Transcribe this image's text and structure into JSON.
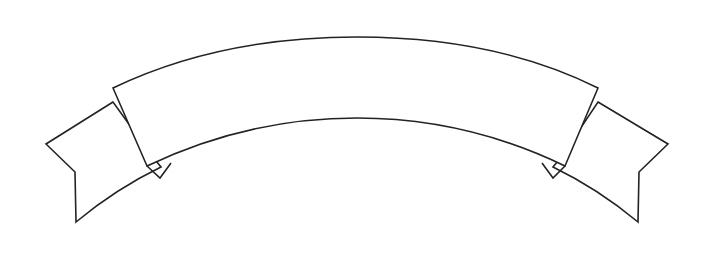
{
  "document": {
    "title": "Banner Ribbon Outline",
    "background_color": "#ffffff",
    "stroke_color": "#232323",
    "fill_color": "#ffffff",
    "stroke_width": 1.6,
    "width": 715,
    "height": 264
  },
  "artwork": {
    "name": "arched-banner-ribbon",
    "description": "Blank line-art scroll banner with arched center panel and two swallowtail ribbon ends",
    "caption_text": "",
    "parts": [
      {
        "name": "left-tail",
        "label": "Left ribbon tail"
      },
      {
        "name": "right-tail",
        "label": "Right ribbon tail"
      },
      {
        "name": "center-panel",
        "label": "Center arched panel"
      },
      {
        "name": "left-fold",
        "label": "Left fold notch"
      },
      {
        "name": "right-fold",
        "label": "Right fold notch"
      }
    ]
  },
  "geometry": {
    "center_panel": {
      "top_left": [
        113,
        88
      ],
      "top_right": [
        598,
        88
      ],
      "top_arc_apex": [
        357,
        37
      ],
      "bottom_left": [
        146,
        166
      ],
      "bottom_right": [
        565,
        166
      ],
      "bottom_arc_apex": [
        357,
        118
      ]
    },
    "left_tail": {
      "inner_top": [
        113,
        102
      ],
      "outer_point": [
        46,
        144
      ],
      "notch": [
        75,
        172
      ],
      "bottom_tip": [
        76,
        222
      ],
      "fold_outer": [
        160,
        167
      ],
      "fold_inner": [
        152,
        156
      ]
    },
    "right_tail": {
      "inner_top": [
        598,
        102
      ],
      "outer_point": [
        668,
        144
      ],
      "notch": [
        639,
        172
      ],
      "bottom_tip": [
        638,
        222
      ],
      "fold_outer": [
        554,
        167
      ],
      "fold_inner": [
        562,
        156
      ]
    }
  }
}
